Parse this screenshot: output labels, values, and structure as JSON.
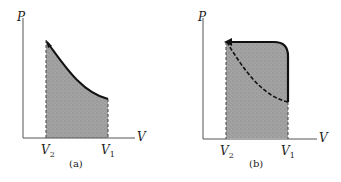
{
  "panels": [
    {
      "id": "a",
      "caption": "(a)",
      "y_axis_label": "P",
      "x_axis_label": "V",
      "x_ticks": [
        {
          "main": "V",
          "sub": "2"
        },
        {
          "main": "V",
          "sub": "1"
        }
      ],
      "description": "Compression along curve from V1 to V2; shaded area under curve"
    },
    {
      "id": "b",
      "caption": "(b)",
      "y_axis_label": "P",
      "x_axis_label": "V",
      "x_ticks": [
        {
          "main": "V",
          "sub": "2"
        },
        {
          "main": "V",
          "sub": "1"
        }
      ],
      "description": "Path from V1 up and left at high pressure to V2, compared with curved path; shaded area under upper path"
    }
  ],
  "colors": {
    "fill": "#9a9a9a",
    "line": "#111111",
    "axis": "#555555"
  }
}
